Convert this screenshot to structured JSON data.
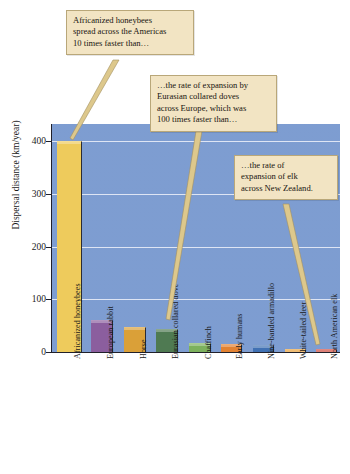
{
  "chart_data": {
    "type": "bar",
    "title": "",
    "subtitle": "",
    "xlabel": "",
    "ylabel": "Dispersal distance (km/year)",
    "ylim": [
      0,
      420
    ],
    "yticks": [
      0,
      100,
      200,
      300,
      400
    ],
    "ytick_labels": [
      "0",
      "100",
      "200",
      "300",
      "400"
    ],
    "grid": true,
    "legend": "none",
    "categories": [
      "Africanized honeybees",
      "European rabbit",
      "Horse",
      "Eurasian collared dove",
      "Chaffinch",
      "Early humans",
      "Nine-banded armadillo",
      "White-tailed deer",
      "North American elk"
    ],
    "values": [
      400,
      60,
      47,
      43,
      17,
      15,
      14,
      6,
      5
    ],
    "bar_colors": [
      "#eecb5c",
      "#8b5e9e",
      "#daa038",
      "#4f7a52",
      "#7cb15d",
      "#e28232",
      "#4171b3",
      "#e9a13c",
      "#cf4b3f"
    ],
    "plot_background": "#7b9bd0",
    "gridline_color": "#eef2fa",
    "annotations": [
      {
        "id": "callout-honeybees",
        "text": "Africanized honeybees spread across the Americas 10 times faster than…",
        "lines": [
          "Africanized honeybees",
          "spread across the Americas",
          "10 times faster than…"
        ],
        "points_to": "Africanized honeybees"
      },
      {
        "id": "callout-doves",
        "text": "…the rate of expansion by Eurasian collared doves across Europe, which was 100 times faster than…",
        "lines": [
          "…the rate of expansion by",
          "Eurasian collared doves",
          "across Europe, which was",
          "100 times faster than…"
        ],
        "points_to": "Eurasian collared dove"
      },
      {
        "id": "callout-elk",
        "text": "…the rate of expansion of elk across New Zealand.",
        "lines": [
          "…the rate of",
          "expansion of elk",
          "across New Zealand."
        ],
        "points_to": "North American elk"
      }
    ]
  },
  "colors": {
    "callout_fill": "#f2e4c3",
    "callout_border": "#b9a779",
    "leader_fill": "#ddc88c",
    "axis": "#20202a",
    "text": "#1a1a1a"
  }
}
